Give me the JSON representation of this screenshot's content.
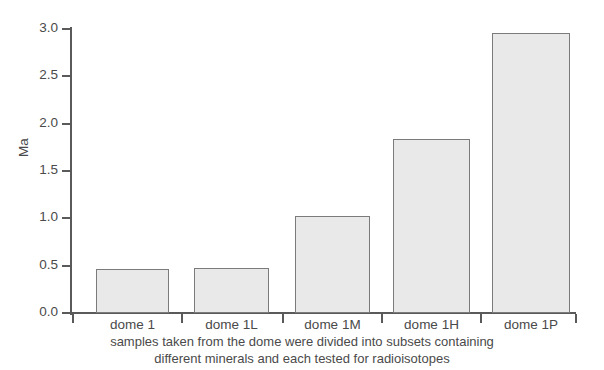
{
  "chart_data": {
    "type": "bar",
    "title": "",
    "subtitle": "",
    "categories": [
      "dome 1",
      "dome 1L",
      "dome 1M",
      "dome 1H",
      "dome 1P"
    ],
    "values": [
      0.47,
      0.48,
      1.02,
      1.84,
      2.96
    ],
    "xlabel": "",
    "ylabel": "Ma",
    "ylim": [
      0.0,
      3.0
    ],
    "yticks": [
      "0.0",
      "0.5",
      "1.0",
      "1.5",
      "2.0",
      "2.5",
      "3.0"
    ],
    "ytick_values": [
      0.0,
      0.5,
      1.0,
      1.5,
      2.0,
      2.5,
      3.0
    ],
    "grid": false,
    "legend": "none",
    "bar_fill_color": "#e9e9e9",
    "bar_edge_color": "#7b7b7b",
    "axis_color": "#5a5a5a",
    "background_color": "#ffffff",
    "annotations": [
      "samples taken from the dome were divided into subsets containing",
      "different minerals and each tested for radioisotopes"
    ]
  },
  "caption": {
    "line1": "samples taken from the dome were divided into subsets containing",
    "line2": "different minerals and each tested for radioisotopes"
  }
}
